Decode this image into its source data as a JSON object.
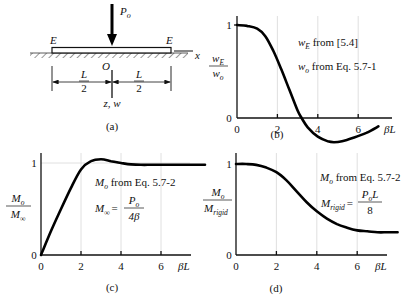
{
  "figure": {
    "panel_a": {
      "caption": "(a)",
      "load_label": "P",
      "load_sub": "o",
      "end_label_left": "E",
      "end_label_right": "E",
      "origin_label": "O",
      "x_axis_label": "x",
      "z_axis_label": "z, w",
      "half_span_num": "L",
      "half_span_den": "2"
    },
    "panel_b": {
      "caption": "(b)",
      "ylabel_num": "w",
      "ylabel_num_sub": "E",
      "ylabel_den": "w",
      "ylabel_den_sub": "o",
      "note1_main": "w",
      "note1_sub": "E",
      "note1_rest": " from [5.4]",
      "note2_main": "w",
      "note2_sub": "o",
      "note2_rest": " from Eq. 5.7-1",
      "xlabel": "βL"
    },
    "panel_c": {
      "caption": "(c)",
      "ylabel_num": "M",
      "ylabel_num_sub": "o",
      "ylabel_den": "M",
      "ylabel_den_sub": "∞",
      "note1_main": "M",
      "note1_sub": "o",
      "note1_rest": " from Eq. 5.7-2",
      "note2_lhs": "M",
      "note2_lhs_sub": "∞",
      "note2_eq": "=",
      "note2_num": "P",
      "note2_num_sub": "o",
      "note2_den": "4β",
      "xlabel": "βL"
    },
    "panel_d": {
      "caption": "(d)",
      "ylabel_num": "M",
      "ylabel_num_sub": "o",
      "ylabel_den": "M",
      "ylabel_den_sub": "rigid",
      "note1_main": "M",
      "note1_sub": "o",
      "note1_rest": " from Eq. 5.7-2",
      "note2_lhs": "M",
      "note2_lhs_sub": "rigid",
      "note2_eq": "=",
      "note2_num": "P",
      "note2_num_sub": "o",
      "note2_num_tail": "L",
      "note2_den": "8",
      "xlabel": "βL"
    }
  },
  "chart_data": [
    {
      "panel": "b",
      "type": "line",
      "title": "",
      "xlabel": "βL",
      "ylabel": "wE / wo",
      "annotations": [
        "wE from [5.4]",
        "wo from Eq. 5.7-1"
      ],
      "x_ticks": [
        0,
        2,
        4,
        6
      ],
      "y_ticks": [
        0,
        1
      ],
      "xlim": [
        0,
        7.6
      ],
      "ylim": [
        -0.3,
        1.05
      ],
      "grid": "faint vertical lines at x ticks",
      "x": [
        0,
        0.5,
        1.0,
        1.4,
        1.8,
        2.2,
        2.6,
        3.0,
        3.2,
        3.5,
        4.0,
        4.5,
        4.8,
        5.2,
        5.8,
        6.4,
        7.0
      ],
      "y": [
        1.0,
        0.99,
        0.96,
        0.88,
        0.72,
        0.52,
        0.3,
        0.08,
        0.0,
        -0.1,
        -0.2,
        -0.25,
        -0.26,
        -0.25,
        -0.21,
        -0.16,
        -0.09
      ]
    },
    {
      "panel": "c",
      "type": "line",
      "title": "",
      "xlabel": "βL",
      "ylabel": "Mo / M∞",
      "annotations": [
        "Mo from Eq. 5.7-2",
        "M∞ = Po / 4β"
      ],
      "x_ticks": [
        0,
        2,
        4,
        6
      ],
      "y_ticks": [
        0,
        1
      ],
      "xlim": [
        0,
        7.6
      ],
      "ylim": [
        0,
        1.1
      ],
      "grid": "faint vertical lines at x ticks, faint horizontal line at y=1",
      "x": [
        0,
        0.5,
        1.0,
        1.5,
        2.0,
        2.5,
        3.0,
        3.5,
        4.0,
        4.5,
        5.0,
        5.5,
        6.0,
        7.0,
        8.2
      ],
      "y": [
        0.0,
        0.26,
        0.5,
        0.73,
        0.93,
        1.02,
        1.04,
        1.02,
        1.0,
        0.985,
        0.98,
        0.98,
        0.98,
        0.98,
        0.98
      ]
    },
    {
      "panel": "d",
      "type": "line",
      "title": "",
      "xlabel": "βL",
      "ylabel": "Mo / Mrigid",
      "annotations": [
        "Mo from Eq. 5.7-2",
        "Mrigid = Po L / 8"
      ],
      "x_ticks": [
        0,
        2,
        4,
        6
      ],
      "y_ticks": [
        0,
        1
      ],
      "xlim": [
        0,
        7.6
      ],
      "ylim": [
        0,
        1.05
      ],
      "grid": "faint vertical lines at x ticks",
      "x": [
        0,
        0.5,
        1.0,
        1.5,
        2.0,
        2.5,
        3.0,
        3.5,
        4.0,
        4.5,
        5.0,
        5.5,
        6.0,
        6.5,
        7.0,
        7.5,
        8.0
      ],
      "y": [
        1.0,
        1.0,
        0.99,
        0.96,
        0.91,
        0.82,
        0.7,
        0.58,
        0.48,
        0.4,
        0.34,
        0.3,
        0.27,
        0.26,
        0.25,
        0.25,
        0.25
      ]
    }
  ]
}
